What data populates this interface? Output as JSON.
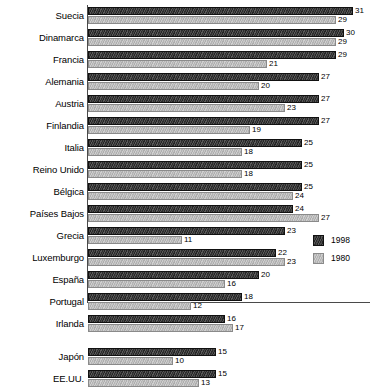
{
  "chart_data": {
    "type": "bar",
    "orientation": "horizontal",
    "title": "",
    "subtitle": "",
    "xlabel": "",
    "ylabel": "",
    "xlim": [
      0,
      33
    ],
    "grid": false,
    "legend_position": "right-lower",
    "categories": [
      "Suecia",
      "Dinamarca",
      "Francia",
      "Alemania",
      "Austria",
      "Finlandia",
      "Italia",
      "Reino Unido",
      "Bélgica",
      "Países Bajos",
      "Grecia",
      "Luxemburgo",
      "España",
      "Portugal",
      "Irlanda",
      "Japón",
      "EE.UU."
    ],
    "series": [
      {
        "name": "1998",
        "color": "#333333",
        "values": [
          31,
          30,
          29,
          27,
          27,
          27,
          25,
          25,
          25,
          24,
          23,
          22,
          20,
          18,
          16,
          15,
          15
        ]
      },
      {
        "name": "1980",
        "color": "#bdbdbd",
        "values": [
          29,
          29,
          21,
          20,
          23,
          19,
          18,
          18,
          24,
          27,
          11,
          23,
          16,
          12,
          17,
          10,
          13
        ]
      }
    ],
    "group_breaks_after": [
      "Irlanda"
    ]
  },
  "legend": {
    "entries": [
      {
        "label": "1998",
        "swatch": "dark-hatched-swatch"
      },
      {
        "label": "1980",
        "swatch": "light-hatched-swatch"
      }
    ]
  }
}
